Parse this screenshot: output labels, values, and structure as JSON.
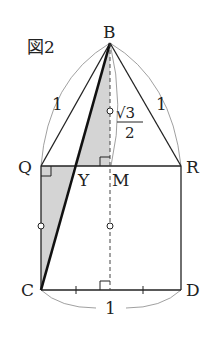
{
  "figure": {
    "title": "図2",
    "points": {
      "B": "B",
      "Q": "Q",
      "R": "R",
      "M": "M",
      "Y": "Y",
      "C": "C",
      "D": "D"
    },
    "lengths": {
      "BQ": "1",
      "BR": "1",
      "CD": "1",
      "BM_numerator": "√3",
      "BM_denominator": "2"
    },
    "colors": {
      "line": "#222222",
      "shade": "#d4d4d4",
      "arc": "#888888"
    }
  }
}
